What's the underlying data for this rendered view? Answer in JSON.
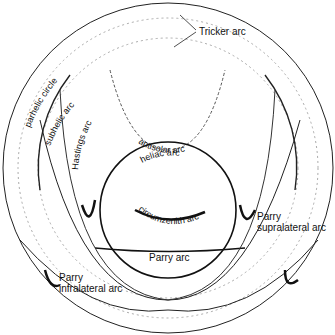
{
  "diagram": {
    "labels": {
      "tricker": "Tricker arc",
      "parhelic": "parhelic circle",
      "subhelic": "subhelic arc",
      "hastings": "Hastings arc",
      "antisolar": "antisolar arc",
      "heliac": "heliac arc",
      "circumzenith": "circumzenith arc",
      "parry_supra_1": "Parry",
      "parry_supra_2": "supralateral arc",
      "parry": "Parry arc",
      "parry_infra_1": "Parry",
      "parry_infra_2": "infralateral arc"
    }
  }
}
